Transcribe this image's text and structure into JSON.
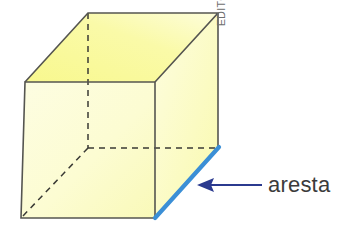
{
  "figure": {
    "type": "geometric-diagram",
    "faces": {
      "front_fill": "#fcfcd2",
      "top_fill": "#fafa9e",
      "right_fill": "#fbfbc0",
      "edge_stroke": "#555550",
      "hidden_edge_stroke": "#3a3a35"
    },
    "highlight": {
      "edge_name": "aresta",
      "color": "#3b8fd6",
      "width": 4
    },
    "arrow": {
      "color": "#2b3a8f",
      "direction": "left",
      "points_to": "aresta"
    },
    "vertices": {
      "front_top_left": [
        25,
        82
      ],
      "front_top_right": [
        155,
        82
      ],
      "front_bottom_right": [
        155,
        218
      ],
      "front_bottom_left": [
        21,
        218
      ],
      "back_top_left": [
        88,
        13
      ],
      "back_top_right": [
        218,
        13
      ],
      "back_bottom_right": [
        218,
        148
      ],
      "back_bottom_left": [
        88,
        148
      ]
    }
  },
  "labels": {
    "edge_label": "aresta",
    "credit": "EDITORIA DE ARTE"
  }
}
